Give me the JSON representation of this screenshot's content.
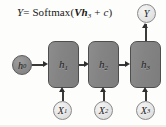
{
  "figure": {
    "equation": {
      "lhs": "Y",
      "eq": "=",
      "fn": "Softmax",
      "open": "(",
      "weight": "V",
      "state": "h",
      "state_sub": "3",
      "plus": "+",
      "bias": "c",
      "close": ")",
      "full_text": "Y = Softmax(Vh3 + c)"
    },
    "hidden_states": [
      {
        "label": "h",
        "sub": "1",
        "name": "hidden-state-1"
      },
      {
        "label": "h",
        "sub": "2",
        "name": "hidden-state-2"
      },
      {
        "label": "h",
        "sub": "3",
        "name": "hidden-state-3"
      }
    ],
    "initial_state": {
      "label": "h",
      "sub": "0"
    },
    "inputs": [
      {
        "label": "X",
        "sub": "1"
      },
      {
        "label": "X",
        "sub": "2"
      },
      {
        "label": "X",
        "sub": "3"
      }
    ],
    "output": {
      "label": "Y"
    },
    "colors": {
      "box_fill": "#848484",
      "box_stroke": "#4e4e4e",
      "dark_circle_fill": "#8b8b8b",
      "light_circle_fill": "#e4e4e4",
      "arrow": "#2f2f2f",
      "text": "#171717",
      "background": "#fdfdfc"
    }
  }
}
